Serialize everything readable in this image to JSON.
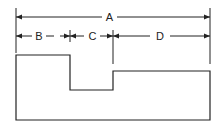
{
  "diagram": {
    "title": "",
    "dimensions": [
      {
        "label": "A",
        "from_x": 16,
        "to_x": 210,
        "y": 17
      },
      {
        "label": "B",
        "from_x": 16,
        "to_x": 70,
        "y": 36
      },
      {
        "label": "C",
        "from_x": 70,
        "to_x": 113,
        "y": 36
      },
      {
        "label": "D",
        "from_x": 113,
        "to_x": 210,
        "y": 36
      }
    ],
    "colors": {
      "line": "#222222",
      "background": "#ffffff"
    }
  }
}
